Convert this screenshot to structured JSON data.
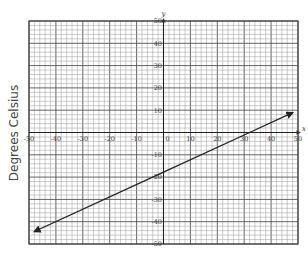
{
  "chart_data": {
    "type": "line",
    "title": "",
    "xlabel": "x",
    "ylabel": "Degrees Celsius",
    "y_axis_name": "y",
    "xlim": [
      -50,
      50
    ],
    "ylim": [
      -50,
      50
    ],
    "grid": true,
    "grid_minor_step": 2,
    "grid_major_step": 10,
    "x_ticks": [
      -50,
      -40,
      -30,
      -20,
      -10,
      0,
      10,
      20,
      30,
      40,
      50
    ],
    "y_ticks": [
      50,
      40,
      30,
      20,
      10,
      -10,
      -20,
      -30,
      -40,
      -50
    ],
    "x_tick_labels": [
      "-50",
      "-40",
      "-30",
      "-20",
      "-10",
      "0",
      "10",
      "20",
      "30",
      "40",
      "50"
    ],
    "y_tick_labels": [
      "50",
      "40",
      "30",
      "20",
      "10",
      "-10",
      "-20",
      "-30",
      "-40",
      "-50"
    ],
    "series": [
      {
        "name": "line",
        "x": [
          -48,
          0,
          32,
          48
        ],
        "y": [
          -44.4,
          -17.8,
          0,
          8.9
        ],
        "arrows": "both",
        "color": "#222222"
      }
    ],
    "legend": null
  },
  "labels": {
    "ylabel": "Degrees Celsius",
    "x_axis": "x",
    "y_axis": "y"
  }
}
